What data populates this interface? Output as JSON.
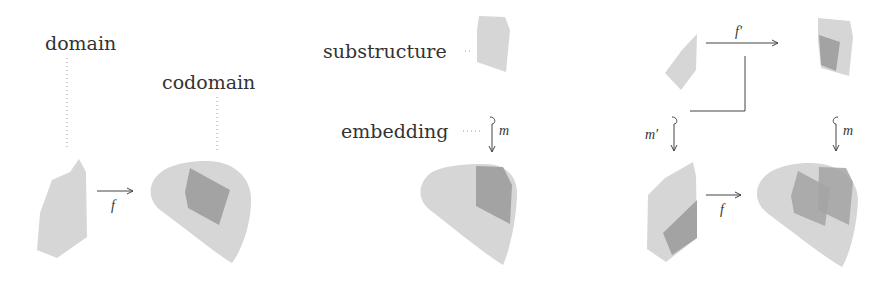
{
  "colors": {
    "light_fill": "#d6d6d6",
    "dark_fill": "#a3a3a3",
    "stroke": "#444444",
    "text": "#333333",
    "dotted": "#999999"
  },
  "panels": [
    {
      "id": "function",
      "labels": {
        "domain": "domain",
        "codomain": "codomain"
      },
      "arrows": [
        {
          "label": "f",
          "direction": "right"
        }
      ]
    },
    {
      "id": "substructure",
      "labels": {
        "substructure": "substructure",
        "embedding": "embedding"
      },
      "arrows": [
        {
          "label": "m",
          "direction": "down",
          "type": "hook"
        }
      ]
    },
    {
      "id": "pullback",
      "arrows": [
        {
          "label": "f′",
          "direction": "right"
        },
        {
          "label": "m′",
          "direction": "down",
          "type": "hook"
        },
        {
          "label": "m",
          "direction": "down",
          "type": "hook"
        },
        {
          "label": "f",
          "direction": "right"
        }
      ],
      "pullback_corner": true
    }
  ]
}
